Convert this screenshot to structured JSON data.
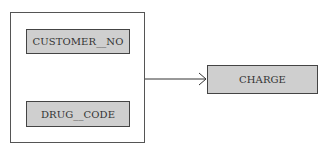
{
  "diagram": {
    "type": "functional-dependency",
    "group": {
      "attributes": [
        {
          "label": "CUSTOMER__NO"
        },
        {
          "label": "DRUG__CODE"
        }
      ]
    },
    "target": {
      "label": "CHARGE"
    },
    "edge": {
      "from": "group",
      "to": "target",
      "style": "arrow"
    }
  }
}
